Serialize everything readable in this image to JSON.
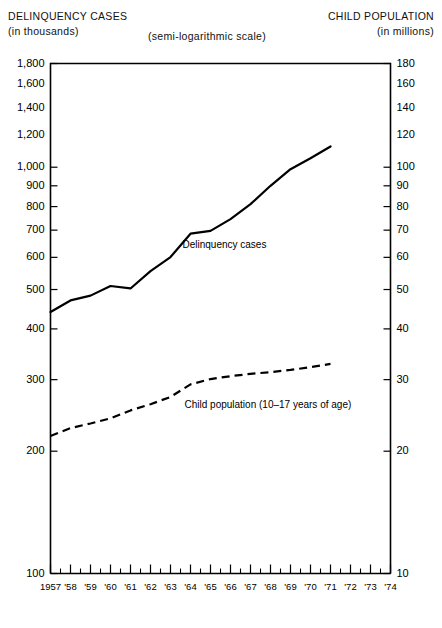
{
  "header": {
    "left_main": "DELINQUENCY CASES",
    "left_sub": "(in thousands)",
    "scale_note": "(semi-logarithmic scale)",
    "right_main": "CHILD POPULATION",
    "right_sub": "(in millions)"
  },
  "chart_data": {
    "type": "line",
    "title": "",
    "subtitle": "(semi-logarithmic scale)",
    "xlabel": "",
    "ylabel": "DELINQUENCY CASES (in thousands)",
    "y2label": "CHILD POPULATION (in millions)",
    "scale": "semi-logarithmic",
    "grid": false,
    "legend": "inline-annotation",
    "x": [
      1957,
      1958,
      1959,
      1960,
      1961,
      1962,
      1963,
      1964,
      1965,
      1966,
      1967,
      1968,
      1969,
      1970,
      1971
    ],
    "xtick_labels": [
      "1957",
      "'58",
      "'59",
      "'60",
      "'61",
      "'62",
      "'63",
      "'64",
      "'65",
      "'66",
      "'67",
      "'68",
      "'69",
      "'70",
      "'71",
      "'72",
      "'73",
      "'74"
    ],
    "xlim": [
      1957,
      1974
    ],
    "ylim": [
      100,
      1800
    ],
    "ytick_labels": [
      "100",
      "200",
      "300",
      "400",
      "500",
      "600",
      "700",
      "800",
      "900",
      "1,000",
      "1,200",
      "1,400",
      "1,600",
      "1,800"
    ],
    "ytick_values": [
      100,
      200,
      300,
      400,
      500,
      600,
      700,
      800,
      900,
      1000,
      1200,
      1400,
      1600,
      1800
    ],
    "y2lim": [
      10,
      180
    ],
    "y2tick_labels": [
      "10",
      "20",
      "30",
      "40",
      "50",
      "60",
      "70",
      "80",
      "90",
      "100",
      "120",
      "140",
      "160",
      "180"
    ],
    "y2tick_values": [
      10,
      20,
      30,
      40,
      50,
      60,
      70,
      80,
      90,
      100,
      120,
      140,
      160,
      180
    ],
    "series": [
      {
        "name": "Delinquency cases",
        "style": "solid",
        "axis": "left",
        "units": "thousands",
        "values": [
          440,
          470,
          483,
          510,
          503,
          555,
          601,
          686,
          697,
          745,
          811,
          900,
          989,
          1052,
          1125
        ]
      },
      {
        "name": "Child population (10–17 years of age)",
        "style": "dashed",
        "axis": "right",
        "units": "millions",
        "values": [
          21.8,
          22.8,
          23.4,
          24.1,
          25.2,
          26.1,
          27.2,
          29.2,
          30.1,
          30.6,
          31.0,
          31.3,
          31.7,
          32.2,
          32.8
        ]
      }
    ],
    "annotations": [
      {
        "text": "Delinquency cases",
        "x": 1963.6,
        "y": 640
      },
      {
        "text": "Child population (10–17 years of age)",
        "x": 1963.7,
        "y": 259
      }
    ]
  }
}
